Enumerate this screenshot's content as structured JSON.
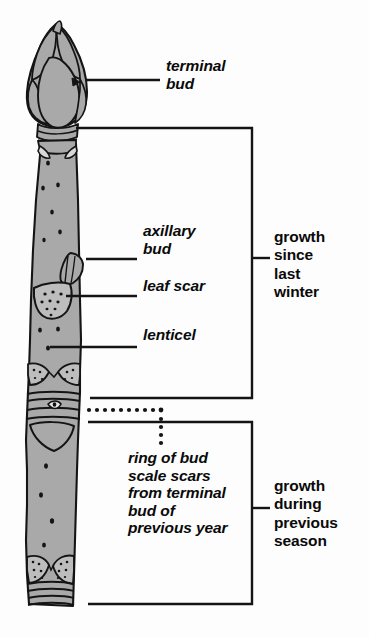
{
  "figure": {
    "colors": {
      "stem_fill": "#a9a9a9",
      "outline": "#141414",
      "text": "#0a0a0a",
      "background": "#fdfdfd"
    }
  },
  "labels": {
    "terminal_bud": "terminal\nbud",
    "axillary_bud": "axillary\nbud",
    "leaf_scar": "leaf scar",
    "lenticel": "lenticel",
    "ring_of_bud_scale_scars": "ring of bud\nscale scars\nfrom terminal\nbud of\nprevious year"
  },
  "brackets": {
    "upper": "growth\nsince\nlast\nwinter",
    "lower": "growth\nduring\nprevious\nseason"
  },
  "icons": {
    "leader_line": "leader-line-icon",
    "dotted_leader": "dotted-leader-icon",
    "bracket": "bracket-icon"
  }
}
